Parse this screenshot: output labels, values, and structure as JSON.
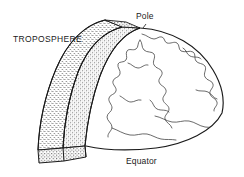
{
  "figure": {
    "type": "scientific-diagram",
    "background_color": "#ffffff",
    "line_color": "#1a1a1a",
    "stipple_color": "#4d4d4d",
    "labels": {
      "troposphere": "TROPOSPHERE",
      "pole": "Pole",
      "equator": "Equator"
    },
    "parts": {
      "globe": "hemisphere",
      "shell": "troposphere-shell",
      "shell_cut_face": "troposphere-cut-face",
      "coastlines": "continent-outlines"
    }
  }
}
